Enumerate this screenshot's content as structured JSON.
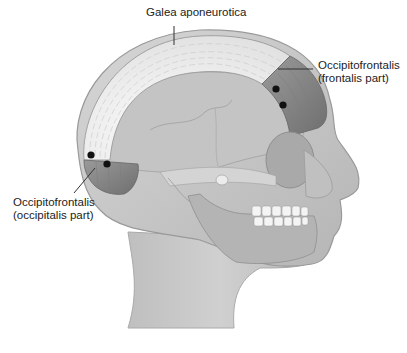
{
  "figure": {
    "type": "anatomical-illustration",
    "labels": {
      "galea": "Galea aponeurotica",
      "frontalis_line1": "Occipitofrontalis",
      "frontalis_line2": "(frontalis part)",
      "occipitalis_line1": "Occipitofrontalis",
      "occipitalis_line2": "(occipitalis part)"
    },
    "colors": {
      "background": "#ffffff",
      "skin": "#c9c9c9",
      "skull": "#bdbdbd",
      "galea": "#f2f2f2",
      "muscle": "#8e8e8e",
      "markers": "#111111",
      "label_text": "#222222",
      "leader_lines": "#333333"
    }
  }
}
